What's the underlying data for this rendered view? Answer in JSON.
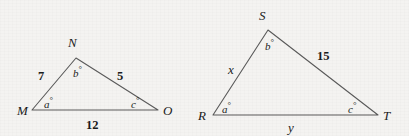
{
  "figure": {
    "background_color": "#f4f3f1",
    "stroke_color": "#5a5a5a",
    "text_color": "#1b1b1b",
    "width": 409,
    "height": 136
  },
  "triangle_left": {
    "name": "triangle-MNO",
    "vertices": {
      "M": {
        "label": "M",
        "x": 32,
        "y": 110
      },
      "N": {
        "label": "N",
        "x": 76,
        "y": 58
      },
      "O": {
        "label": "O",
        "x": 158,
        "y": 110
      }
    },
    "vertex_labels": {
      "M": {
        "text": "M",
        "x": 17,
        "y": 104
      },
      "N": {
        "text": "N",
        "x": 68,
        "y": 36
      },
      "O": {
        "text": "O",
        "x": 163,
        "y": 104
      }
    },
    "sides": [
      {
        "name": "side-MN",
        "text": "7",
        "x": 38,
        "y": 70
      },
      {
        "name": "side-NO",
        "text": "5",
        "x": 117,
        "y": 70
      },
      {
        "name": "side-MO",
        "text": "12",
        "x": 86,
        "y": 119
      }
    ],
    "angles": [
      {
        "name": "angle-M",
        "value": "a",
        "degree": "°",
        "x": 44,
        "y": 96
      },
      {
        "name": "angle-N",
        "value": "b",
        "degree": "°",
        "x": 73,
        "y": 65
      },
      {
        "name": "angle-O",
        "value": "c",
        "degree": "°",
        "x": 131,
        "y": 96
      }
    ]
  },
  "triangle_right": {
    "name": "triangle-RST",
    "vertices": {
      "R": {
        "label": "R",
        "x": 213,
        "y": 115
      },
      "S": {
        "label": "S",
        "x": 268,
        "y": 30
      },
      "T": {
        "label": "T",
        "x": 378,
        "y": 115
      }
    },
    "vertex_labels": {
      "R": {
        "text": "R",
        "x": 198,
        "y": 109
      },
      "S": {
        "text": "S",
        "x": 259,
        "y": 9
      },
      "T": {
        "text": "T",
        "x": 383,
        "y": 109
      }
    },
    "sides": [
      {
        "name": "side-RS",
        "text": "x",
        "x": 228,
        "y": 63
      },
      {
        "name": "side-ST",
        "text": "15",
        "x": 317,
        "y": 50
      },
      {
        "name": "side-RT",
        "text": "y",
        "x": 288,
        "y": 121
      }
    ],
    "angles": [
      {
        "name": "angle-R",
        "value": "a",
        "degree": "°",
        "x": 222,
        "y": 101
      },
      {
        "name": "angle-S",
        "value": "b",
        "degree": "°",
        "x": 265,
        "y": 38
      },
      {
        "name": "angle-T",
        "value": "c",
        "degree": "°",
        "x": 348,
        "y": 101
      }
    ]
  }
}
